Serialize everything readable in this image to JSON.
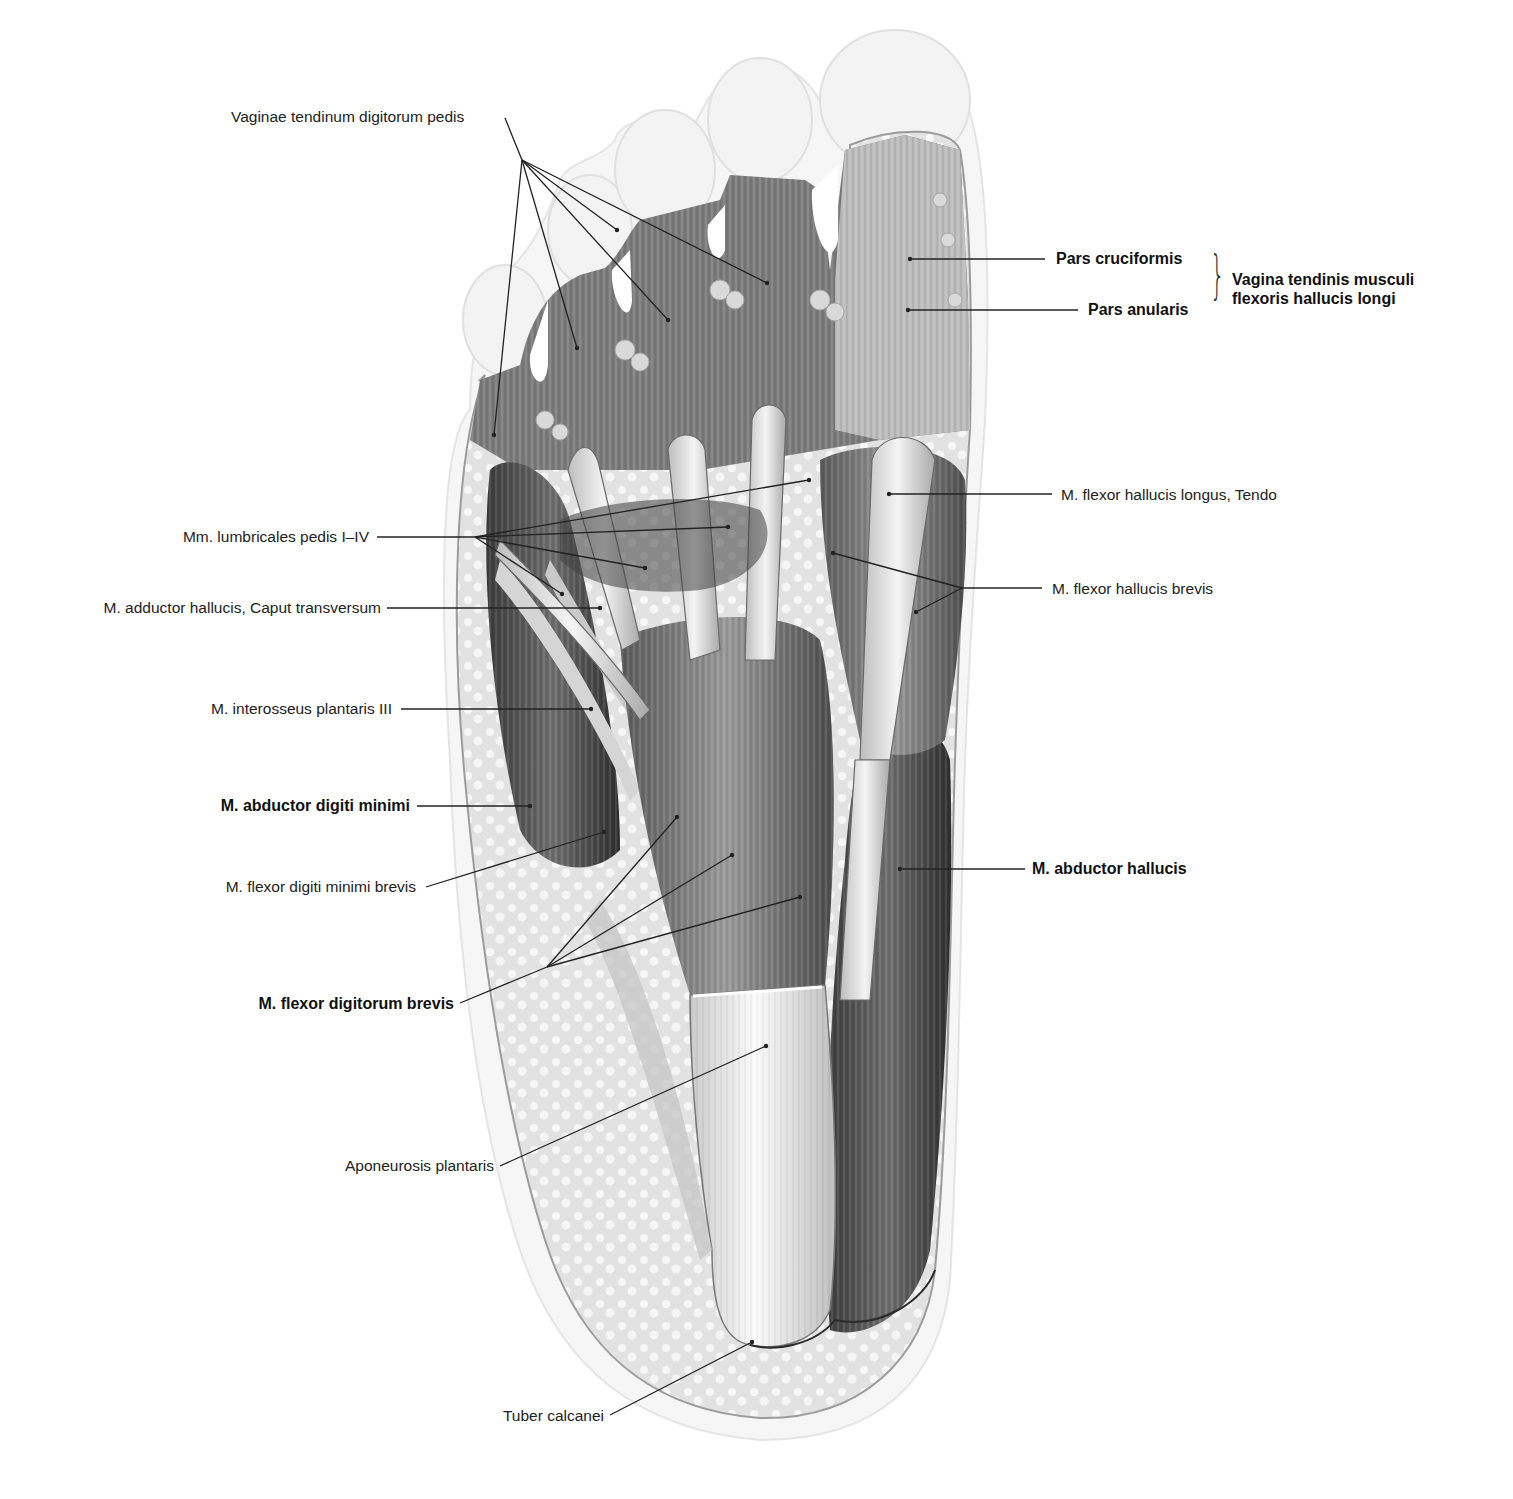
{
  "figure": {
    "colors": {
      "background": "#ffffff",
      "ink": "#1a1a1a",
      "leader": "#222222",
      "tissue_dark": "#4a4a4a",
      "tissue_mid": "#8c8c8c",
      "tissue_light": "#d8d8d8",
      "fat": "#e6e6e6"
    }
  },
  "labels": {
    "vaginae": "Vaginae tendinum digitorum pedis",
    "pars_cruciformis": "Pars cruciformis",
    "pars_anularis": "Pars anularis",
    "vagina_group_line1": "Vagina tendinis musculi",
    "vagina_group_line2": "flexoris hallucis longi",
    "fhl_tendo": "M. flexor hallucis longus, Tendo",
    "fhb": "M. flexor hallucis brevis",
    "lumbricales": "Mm. lumbricales pedis I–IV",
    "adductor": "M. adductor hallucis, Caput transversum",
    "interosseus": "M. interosseus plantaris III",
    "abd_dig_min": "M. abductor digiti minimi",
    "flex_dig_min": "M. flexor digiti minimi brevis",
    "abd_hallucis": "M. abductor hallucis",
    "fdb": "M. flexor digitorum brevis",
    "aponeurosis": "Aponeurosis plantaris",
    "tuber": "Tuber calcanei"
  },
  "leaders": [
    {
      "name": "vaginae",
      "from": [
        505,
        118
      ],
      "hub": [
        522,
        160
      ],
      "to": [
        [
          494,
          435
        ],
        [
          577,
          348
        ],
        [
          668,
          320
        ],
        [
          767,
          283
        ],
        [
          617,
          230
        ]
      ]
    },
    {
      "name": "pars-cruciformis",
      "from": [
        1045,
        259
      ],
      "to": [
        [
          910,
          259
        ]
      ]
    },
    {
      "name": "pars-anularis",
      "from": [
        1078,
        310
      ],
      "to": [
        [
          908,
          310
        ]
      ]
    },
    {
      "name": "fhl-tendo",
      "from": [
        1052,
        494
      ],
      "to": [
        [
          889,
          494
        ]
      ]
    },
    {
      "name": "fhb",
      "from": [
        1042,
        588
      ],
      "hub": [
        962,
        588
      ],
      "to": [
        [
          833,
          553
        ],
        [
          916,
          612
        ]
      ]
    },
    {
      "name": "lumbricales",
      "from": [
        377,
        537
      ],
      "hub": [
        475,
        537
      ],
      "to": [
        [
          809,
          480
        ],
        [
          728,
          527
        ],
        [
          645,
          568
        ],
        [
          562,
          594
        ]
      ]
    },
    {
      "name": "adductor",
      "from": [
        387,
        608
      ],
      "to": [
        [
          600,
          608
        ]
      ]
    },
    {
      "name": "interosseus",
      "from": [
        401,
        709
      ],
      "to": [
        [
          591,
          709
        ]
      ]
    },
    {
      "name": "abd-dig-min",
      "from": [
        417,
        806
      ],
      "to": [
        [
          530,
          806
        ]
      ]
    },
    {
      "name": "flex-dig-min",
      "from": [
        426,
        887
      ],
      "to": [
        [
          604,
          832
        ]
      ]
    },
    {
      "name": "fdb",
      "from": [
        460,
        1003
      ],
      "hub": [
        547,
        967
      ],
      "to": [
        [
          677,
          817
        ],
        [
          732,
          855
        ],
        [
          800,
          897
        ]
      ]
    },
    {
      "name": "aponeurosis",
      "from": [
        500,
        1166
      ],
      "to": [
        [
          766,
          1046
        ]
      ]
    },
    {
      "name": "abd-hallucis",
      "from": [
        1025,
        869
      ],
      "to": [
        [
          900,
          869
        ]
      ]
    },
    {
      "name": "tuber",
      "from": [
        610,
        1415
      ],
      "to": [
        [
          752,
          1342
        ]
      ]
    }
  ]
}
